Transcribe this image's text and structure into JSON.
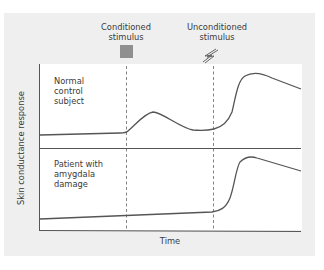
{
  "diagram": {
    "type": "skin-conductance-conditioning-diagram",
    "stimuli": {
      "conditioned": {
        "label_line1": "Conditioned",
        "label_line2": "stimulus",
        "icon": "gray-square-icon",
        "color": "#8f8f8f"
      },
      "unconditioned": {
        "label_line1": "Unconditioned",
        "label_line2": "stimulus",
        "icon": "lightning-bolt-icon",
        "color": "#6a6a6a"
      }
    },
    "panels": [
      {
        "label_line1": "Normal",
        "label_line2": "control",
        "label_line3": "subject"
      },
      {
        "label_line1": "Patient with",
        "label_line2": "amygdala",
        "label_line3": "damage"
      }
    ],
    "axes": {
      "ylabel": "Skin conductance response",
      "xlabel": "Time"
    },
    "colors": {
      "panel_background": "#efefef",
      "plot_background": "#ffffff",
      "curve": "#555555",
      "axis": "#555555",
      "dashed_marker": "#666666"
    }
  }
}
